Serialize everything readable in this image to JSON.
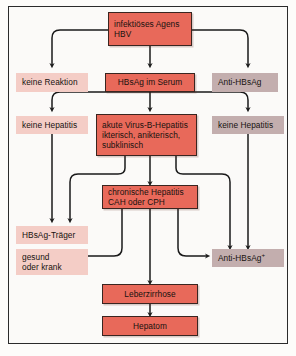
{
  "figure": {
    "language": "de",
    "background_color": "#fbfaf8",
    "frame_color": "#2b2b2b"
  },
  "palette": {
    "red_fill": "#e8695a",
    "red_border": "#3a2520",
    "pink_fill": "#f4cdc6",
    "gray_fill": "#c3aeae",
    "arrow_color": "#1a1a1a",
    "text_color": "#16120f"
  },
  "nodes": {
    "agent": {
      "line1": "infektiöses Agens",
      "line2": "HBV",
      "style": "red"
    },
    "no_reaction": {
      "line1": "keine Reaktion",
      "style": "pink"
    },
    "hbsag_serum": {
      "line1": "HBsAg im Serum",
      "style": "red"
    },
    "anti_hbsag": {
      "line1": "Anti-HBsAg",
      "style": "gray"
    },
    "no_hep_left": {
      "line1": "keine Hepatitis",
      "style": "pink"
    },
    "acute": {
      "line1": "akute Virus-B-Hepatitis",
      "line2": "ikterisch, anikterisch,",
      "line3": "subklinisch",
      "style": "red"
    },
    "no_hep_right": {
      "line1": "keine Hepatitis",
      "style": "gray"
    },
    "carrier": {
      "line1": "HBsAg-Träger",
      "style": "pink"
    },
    "chronic": {
      "line1": "chronische Hepatitis",
      "line2": "CAH oder CPH",
      "style": "red"
    },
    "healthy_ill": {
      "line1": "gesund",
      "line2": "oder krank",
      "style": "pink"
    },
    "anti_hbsag_pos": {
      "line1": "Anti-HBsAg",
      "superscript": "+",
      "style": "gray"
    },
    "cirrhosis": {
      "line1": "Leberzirrhose",
      "style": "red"
    },
    "hepatoma": {
      "line1": "Hepatom",
      "style": "red"
    }
  },
  "edges": [
    {
      "from": "agent",
      "to": "no_reaction",
      "route": "elbow-left"
    },
    {
      "from": "agent",
      "to": "hbsag_serum",
      "route": "straight-down"
    },
    {
      "from": "agent",
      "to": "anti_hbsag",
      "route": "elbow-right"
    },
    {
      "from": "hbsag_serum",
      "to": "no_hep_left",
      "route": "elbow-left"
    },
    {
      "from": "hbsag_serum",
      "to": "acute",
      "route": "straight-down"
    },
    {
      "from": "hbsag_serum",
      "to": "no_hep_right",
      "route": "elbow-right"
    },
    {
      "from": "no_hep_left",
      "to": "carrier",
      "route": "straight-down"
    },
    {
      "from": "acute",
      "to": "carrier",
      "route": "elbow-left"
    },
    {
      "from": "acute",
      "to": "chronic",
      "route": "straight-down"
    },
    {
      "from": "acute",
      "to": "anti_hbsag_pos",
      "route": "elbow-right"
    },
    {
      "from": "no_hep_right",
      "to": "anti_hbsag_pos",
      "route": "straight-down"
    },
    {
      "from": "chronic",
      "to": "healthy_ill",
      "route": "elbow-left-arrowleft"
    },
    {
      "from": "chronic",
      "to": "cirrhosis",
      "route": "straight-down"
    },
    {
      "from": "chronic",
      "to": "anti_hbsag_pos",
      "route": "elbow-right-arrowright"
    },
    {
      "from": "cirrhosis",
      "to": "hepatoma",
      "route": "straight-down"
    }
  ]
}
